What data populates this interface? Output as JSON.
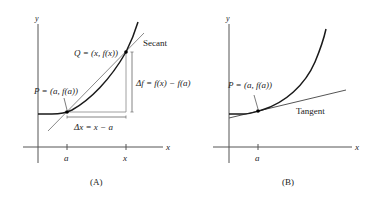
{
  "panelA": {
    "caption": "(A)",
    "y_axis_label": "y",
    "x_axis_label": "x",
    "tick_a": "a",
    "tick_x": "x",
    "point_P": "P = (a, f(a))",
    "point_Q": "Q = (x, f(x))",
    "secant_label": "Secant",
    "delta_x": "Δx = x − a",
    "delta_f": "Δf = f(x) − f(a)"
  },
  "panelB": {
    "caption": "(B)",
    "y_axis_label": "y",
    "x_axis_label": "x",
    "tick_a": "a",
    "point_P": "P = (a, f(a))",
    "tangent_label": "Tangent"
  },
  "colors": {
    "curve": "#1a1a1a",
    "axis": "#555555",
    "secant": "#8a8a8a",
    "tangent": "#555555",
    "guide": "#888888"
  }
}
